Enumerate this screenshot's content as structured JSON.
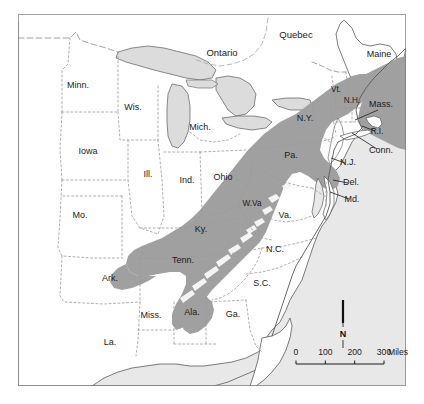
{
  "map": {
    "title": "Appalachian region reference map",
    "frame": {
      "x": 18,
      "y": 14,
      "width": 388,
      "height": 372
    },
    "colors": {
      "ocean": "#e8e8e8",
      "land": "#ffffff",
      "highlight": "#a0a0a0",
      "lake": "#dcdcdc",
      "frame_border": "#7a7a7a",
      "state_border": "#9a9a9a",
      "coastline": "#5a5a5a",
      "label_text": "#1b1b1b",
      "compass_needle": "#101010"
    },
    "us_state_labels": [
      {
        "name": "label-minnesota",
        "text": "Minn.",
        "x": 78,
        "y": 88,
        "size": "normal",
        "leader": null
      },
      {
        "name": "label-wisconsin",
        "text": "Wis.",
        "x": 133,
        "y": 110,
        "size": "normal",
        "leader": null
      },
      {
        "name": "label-michigan",
        "text": "Mich.",
        "x": 200,
        "y": 130,
        "size": "normal",
        "leader": null
      },
      {
        "name": "label-iowa",
        "text": "Iowa",
        "x": 88,
        "y": 154,
        "size": "normal",
        "leader": null
      },
      {
        "name": "label-illinois",
        "text": "Ill.",
        "x": 148,
        "y": 177,
        "size": "normal",
        "leader": null
      },
      {
        "name": "label-indiana",
        "text": "Ind.",
        "x": 187,
        "y": 183,
        "size": "normal",
        "leader": null
      },
      {
        "name": "label-ohio",
        "text": "Ohio",
        "x": 223,
        "y": 180,
        "size": "normal",
        "leader": null
      },
      {
        "name": "label-missouri",
        "text": "Mo.",
        "x": 80,
        "y": 218,
        "size": "normal",
        "leader": null
      },
      {
        "name": "label-kentucky",
        "text": "Ky.",
        "x": 201,
        "y": 232,
        "size": "normal",
        "leader": null
      },
      {
        "name": "label-westvirginia",
        "text": "W.Va",
        "x": 252,
        "y": 206,
        "size": "small",
        "leader": null
      },
      {
        "name": "label-virginia",
        "text": "Va.",
        "x": 285,
        "y": 218,
        "size": "normal",
        "leader": null
      },
      {
        "name": "label-arkansas",
        "text": "Ark.",
        "x": 110,
        "y": 281,
        "size": "normal",
        "leader": null
      },
      {
        "name": "label-tennessee",
        "text": "Tenn.",
        "x": 183,
        "y": 263,
        "size": "normal",
        "leader": null
      },
      {
        "name": "label-northcarolina",
        "text": "N.C.",
        "x": 275,
        "y": 252,
        "size": "normal",
        "leader": null
      },
      {
        "name": "label-southcarolina",
        "text": "S.C.",
        "x": 262,
        "y": 286,
        "size": "normal",
        "leader": null
      },
      {
        "name": "label-mississippi",
        "text": "Miss.",
        "x": 151,
        "y": 318,
        "size": "normal",
        "leader": null
      },
      {
        "name": "label-alabama",
        "text": "Ala.",
        "x": 192,
        "y": 315,
        "size": "normal",
        "leader": null
      },
      {
        "name": "label-georgia",
        "text": "Ga.",
        "x": 233,
        "y": 317,
        "size": "normal",
        "leader": null
      },
      {
        "name": "label-louisiana",
        "text": "La.",
        "x": 110,
        "y": 345,
        "size": "normal",
        "leader": null
      },
      {
        "name": "label-newyork",
        "text": "N.Y.",
        "x": 305,
        "y": 121,
        "size": "normal",
        "leader": null
      },
      {
        "name": "label-pennsylvania",
        "text": "Pa.",
        "x": 291,
        "y": 158,
        "size": "normal",
        "leader": null
      },
      {
        "name": "label-maine",
        "text": "Maine",
        "x": 379,
        "y": 57,
        "size": "normal",
        "leader": null
      },
      {
        "name": "label-vermont",
        "text": "Vt.",
        "x": 336,
        "y": 92,
        "size": "small",
        "leader": null
      },
      {
        "name": "label-newhampshire",
        "text": "N.H.",
        "x": 352,
        "y": 103,
        "size": "small",
        "leader": null
      },
      {
        "name": "label-massachusetts",
        "text": "Mass.",
        "x": 381,
        "y": 107,
        "size": "normal",
        "leader": {
          "x1": 378,
          "y1": 110,
          "x2": 355,
          "y2": 120
        }
      },
      {
        "name": "label-rhodeisland",
        "text": "R.I.",
        "x": 377,
        "y": 134,
        "size": "small",
        "leader": {
          "x1": 375,
          "y1": 131,
          "x2": 362,
          "y2": 126
        }
      },
      {
        "name": "label-connecticut",
        "text": "Conn.",
        "x": 381,
        "y": 153,
        "size": "normal",
        "leader": {
          "x1": 377,
          "y1": 149,
          "x2": 352,
          "y2": 133
        }
      },
      {
        "name": "label-newjersey",
        "text": "N.J.",
        "x": 348,
        "y": 165,
        "size": "normal",
        "leader": {
          "x1": 345,
          "y1": 163,
          "x2": 331,
          "y2": 158
        }
      },
      {
        "name": "label-delaware",
        "text": "Del.",
        "x": 351,
        "y": 185,
        "size": "normal",
        "leader": {
          "x1": 348,
          "y1": 183,
          "x2": 333,
          "y2": 180
        }
      },
      {
        "name": "label-maryland",
        "text": "Md.",
        "x": 352,
        "y": 202,
        "size": "normal",
        "leader": {
          "x1": 349,
          "y1": 199,
          "x2": 330,
          "y2": 192
        }
      }
    ],
    "canada_labels": [
      {
        "name": "label-ontario",
        "text": "Ontario",
        "x": 222,
        "y": 56,
        "size": "big"
      },
      {
        "name": "label-quebec",
        "text": "Quebec",
        "x": 296,
        "y": 38,
        "size": "big"
      }
    ],
    "compass": {
      "label": "N",
      "x": 343,
      "y": 334,
      "needle_top": 300,
      "needle_bottom": 323
    },
    "scalebar": {
      "unit_label": "Miles",
      "ticks": [
        "0",
        "100",
        "200",
        "300"
      ],
      "x": 296,
      "y": 364,
      "width": 88,
      "label_y": 355
    }
  }
}
